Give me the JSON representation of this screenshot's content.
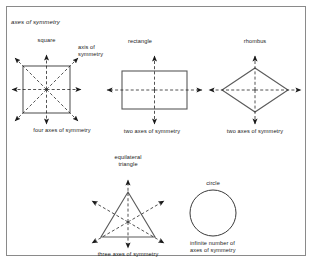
{
  "figure": {
    "heading": "axes of symmetry",
    "callout_label": "axis of\nsymmetry",
    "callout_line1": "axis of",
    "callout_line2": "symmetry",
    "frame_color": "#8a8a8a",
    "shape_stroke": "#5a5a5a",
    "axis_color": "#1a1a1a",
    "text_color": "#1a1a1a"
  },
  "shapes": [
    {
      "id": "square",
      "name": "square",
      "caption": "four axes of symmetry",
      "axes_count": 4,
      "axis_types": [
        "vertical",
        "horizontal",
        "diagonal-up",
        "diagonal-down"
      ]
    },
    {
      "id": "rectangle",
      "name": "rectangle",
      "caption": "two axes of symmetry",
      "axes_count": 2,
      "axis_types": [
        "vertical",
        "horizontal"
      ]
    },
    {
      "id": "rhombus",
      "name": "rhombus",
      "caption": "two axes of symmetry",
      "axes_count": 2,
      "axis_types": [
        "vertical",
        "horizontal"
      ]
    },
    {
      "id": "triangle",
      "name_line1": "equilateral",
      "name_line2": "triangle",
      "name": "equilateral triangle",
      "caption": "three axes of symmetry",
      "axes_count": 3,
      "axis_types": [
        "vertical",
        "oblique-left",
        "oblique-right"
      ]
    },
    {
      "id": "circle",
      "name": "circle",
      "caption_line1": "infinite number of",
      "caption_line2": "axes of symmetry",
      "caption": "infinite number of axes of symmetry",
      "axes_count": "infinite",
      "axis_types": []
    }
  ]
}
